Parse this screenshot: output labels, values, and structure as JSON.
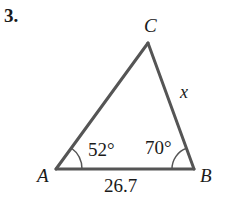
{
  "problem": {
    "number": "3."
  },
  "triangle": {
    "vertices": [
      {
        "name": "A",
        "x": 56,
        "y": 169
      },
      {
        "name": "B",
        "x": 194,
        "y": 169
      },
      {
        "name": "C",
        "x": 148,
        "y": 43
      }
    ],
    "labels": {
      "A": "A",
      "B": "B",
      "C": "C"
    },
    "sides": {
      "AB": "26.7",
      "BC": "x"
    },
    "angles": {
      "A": "52°",
      "B": "70°"
    },
    "stroke_color": "#555555",
    "text_color": "#1a1a1a"
  }
}
